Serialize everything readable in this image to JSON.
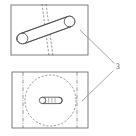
{
  "figure": {
    "background_color": "#ffffff",
    "line_color": "#4a4a4a",
    "hidden_line_color": "#6b6b6b",
    "leader_color": "#8a8a8a"
  },
  "reference_numerals": [
    {
      "id": "ref-3",
      "label": "3",
      "x": 117,
      "y": 68,
      "leaders": [
        {
          "from_x": 115,
          "from_y": 64,
          "to_x": 80,
          "to_y": 30
        },
        {
          "from_x": 114,
          "from_y": 70,
          "to_x": 82,
          "to_y": 101
        }
      ]
    }
  ],
  "views": {
    "top_view": {
      "name": "top-view",
      "outline": {
        "x": 11,
        "y": 5,
        "width": 77,
        "height": 50
      },
      "rod": {
        "name": "diagonal-rod",
        "end_a": {
          "cx": 22.5,
          "cy": 38.5,
          "r": 5.2
        },
        "end_b": {
          "cx": 69.5,
          "cy": 21.5,
          "r": 5.2
        },
        "body_top": {
          "x1": 21,
          "y1": 33.5,
          "x2": 68,
          "y2": 16.6
        },
        "body_bottom": {
          "x1": 24,
          "y1": 43.4,
          "x2": 71,
          "y2": 26.5
        }
      },
      "hidden_lines": [
        {
          "x1": 42,
          "y1": 4,
          "x2": 49,
          "y2": 56
        },
        {
          "x1": 46,
          "y1": 4,
          "x2": 53,
          "y2": 56
        }
      ]
    },
    "bottom_view": {
      "name": "bottom-view",
      "outline": {
        "x": 12,
        "y": 72,
        "width": 76,
        "height": 56
      },
      "hidden_circle": {
        "cx": 50.5,
        "cy": 100.5,
        "r": 25.5
      },
      "center_lines": [
        {
          "x1": 23,
          "y1": 71,
          "x2": 23,
          "y2": 129
        },
        {
          "x1": 77,
          "y1": 71,
          "x2": 77,
          "y2": 129
        }
      ],
      "center_pin": {
        "name": "center-pin",
        "x": 40,
        "y": 97,
        "width": 22,
        "height": 6.5,
        "segments": [
          44.5,
          48.5,
          52.5,
          56.5
        ]
      }
    }
  }
}
